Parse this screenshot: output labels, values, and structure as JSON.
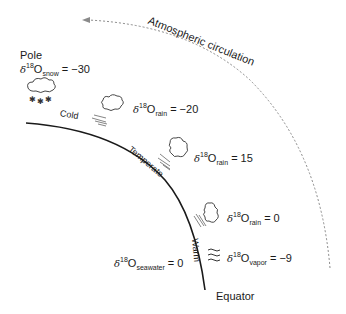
{
  "diagram": {
    "type": "oxygen-isotope-latitudinal-fractionation",
    "circulation_label": "Atmospheric circulation",
    "pole_label": "Pole",
    "equator_label": "Equator",
    "zones": {
      "cold": "Cold",
      "temperate": "Temperate",
      "warm": "Warm"
    },
    "labels": {
      "snow": {
        "delta": "δ",
        "sup": "18",
        "o": "O",
        "sub": "snow",
        "eq": " = −30"
      },
      "rain_cold": {
        "delta": "δ",
        "sup": "18",
        "o": "O",
        "sub": "rain",
        "eq": " = −20"
      },
      "rain_temp": {
        "delta": "δ",
        "sup": "18",
        "o": "O",
        "sub": "rain",
        "eq": " = 15"
      },
      "rain_warm": {
        "delta": "δ",
        "sup": "18",
        "o": "O",
        "sub": "rain",
        "eq": " = 0"
      },
      "vapor": {
        "delta": "δ",
        "sup": "18",
        "o": "O",
        "sub": "vapor",
        "eq": " = −9"
      },
      "seawater": {
        "delta": "δ",
        "sup": "18",
        "o": "O",
        "sub": "seawater",
        "eq": " = 0"
      }
    },
    "colors": {
      "line": "#1a1a1a",
      "dashed": "#8a8a8a",
      "text": "#1a1a1a"
    }
  }
}
